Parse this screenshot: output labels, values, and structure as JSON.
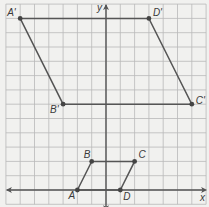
{
  "figure": {
    "title_cropped": "",
    "grid": {
      "x_min": -7,
      "x_max": 7,
      "y_min": -1,
      "y_max": 13,
      "unit_px": 14.3,
      "origin_px": [
        106,
        190
      ],
      "background": "#f1f1ef",
      "grid_color": "#b9b9b9",
      "axis_color": "#555555",
      "shape_color": "#555555"
    },
    "axes": {
      "x_label": "x",
      "y_label": "y"
    },
    "original_figure": {
      "name": "ABCD",
      "points": [
        {
          "label": "A",
          "x": -2,
          "y": 0
        },
        {
          "label": "B",
          "x": -1,
          "y": 2
        },
        {
          "label": "C",
          "x": 2,
          "y": 2
        },
        {
          "label": "D",
          "x": 1,
          "y": 0
        }
      ]
    },
    "image_figure": {
      "name": "A'B'C'D'",
      "points": [
        {
          "label": "A'",
          "x": -6,
          "y": 12
        },
        {
          "label": "B'",
          "x": -3,
          "y": 6
        },
        {
          "label": "C'",
          "x": 6,
          "y": 6
        },
        {
          "label": "D'",
          "x": 3,
          "y": 12
        }
      ]
    }
  }
}
